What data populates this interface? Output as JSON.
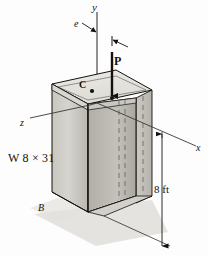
{
  "figure": {
    "type": "engineering-mechanics-diagram",
    "labels": {
      "axis_y": "y",
      "axis_x": "x",
      "axis_z": "z",
      "load": "P",
      "eccentricity": "e",
      "centroid": "C",
      "base_point": "B",
      "section": "W 8 × 31",
      "height": "8 ft"
    },
    "colors": {
      "outline": "#14120f",
      "top_face": "#e4e2dd",
      "front_face_light": "#cfcdc7",
      "front_face_dark": "#b4b2ab",
      "side_face": "#c6c4bd",
      "web_face": "#bcbab3",
      "shadow": "#dcdad5",
      "hidden_line": "#6b6862",
      "background": "#fdfdfd"
    }
  }
}
